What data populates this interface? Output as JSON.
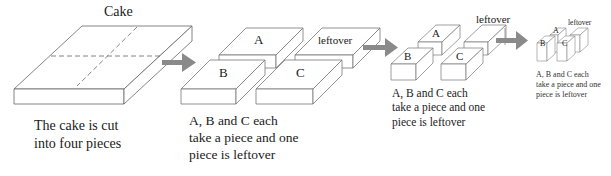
{
  "diagram": {
    "type": "process-flow",
    "stages": [
      {
        "id": "stage-1",
        "title": "Cake",
        "caption": [
          "The cake is cut",
          "into four pieces"
        ]
      },
      {
        "id": "stage-2",
        "pieces": [
          "A",
          "leftover",
          "B",
          "C"
        ],
        "caption": [
          "A, B and C each",
          "take a piece and one",
          "piece is leftover"
        ]
      },
      {
        "id": "stage-3",
        "pieces": [
          "A",
          "B",
          "C"
        ],
        "leftover_label": "leftover",
        "caption": [
          "A, B and C each",
          "take a piece and one",
          "piece is leftover"
        ]
      },
      {
        "id": "stage-4",
        "pieces": [
          "A",
          "B",
          "C"
        ],
        "leftover_label": "leftover",
        "caption": [
          "A, B and C each",
          "take a piece and one",
          "piece is leftover"
        ]
      }
    ],
    "arrow_color": "#8a8a8a",
    "line_color": "#555555"
  }
}
